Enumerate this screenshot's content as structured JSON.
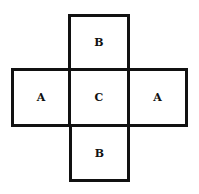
{
  "diagram": {
    "type": "cube-net",
    "cells": [
      {
        "id": "top",
        "label": "B"
      },
      {
        "id": "left",
        "label": "A"
      },
      {
        "id": "center",
        "label": "C"
      },
      {
        "id": "right",
        "label": "A"
      },
      {
        "id": "bottom",
        "label": "B"
      }
    ]
  }
}
